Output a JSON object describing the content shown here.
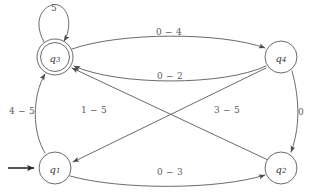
{
  "diagram": {
    "type": "finite-state-automaton",
    "colors": {
      "stroke": "#5a5a5a",
      "start_arrow": "#2b2b2b",
      "text": "#5a5a5a",
      "state_text": "#3a3a3a",
      "background": "#ffffff"
    },
    "states": [
      {
        "id": "q1",
        "label_base": "q",
        "label_sub": "1",
        "cx": 55,
        "cy": 168,
        "r": 16,
        "accepting": false,
        "start": true
      },
      {
        "id": "q2",
        "label_base": "q",
        "label_sub": "2",
        "cx": 281,
        "cy": 168,
        "r": 16,
        "accepting": false,
        "start": false
      },
      {
        "id": "q3",
        "label_base": "q",
        "label_sub": "3",
        "cx": 55,
        "cy": 57,
        "r": 18,
        "r_inner": 15,
        "accepting": true,
        "start": false
      },
      {
        "id": "q4",
        "label_base": "q",
        "label_sub": "4",
        "cx": 281,
        "cy": 57,
        "r": 16,
        "accepting": false,
        "start": false
      }
    ],
    "transitions": [
      {
        "id": "t-q3-self",
        "from": "q3",
        "to": "q3",
        "label": "5",
        "label_x": 54,
        "label_y": 8,
        "kind": "self-loop"
      },
      {
        "id": "t-q3-q4-top",
        "from": "q3",
        "to": "q4",
        "label": "0 − 4",
        "label_x": 169,
        "label_y": 32,
        "kind": "curve-top"
      },
      {
        "id": "t-q4-q3-bottom",
        "from": "q4",
        "to": "q3",
        "label": "0 − 2",
        "label_x": 170,
        "label_y": 76,
        "kind": "curve-bottom"
      },
      {
        "id": "t-q1-q3-left",
        "from": "q1",
        "to": "q3",
        "label": "4 − 5",
        "label_x": 22,
        "label_y": 111,
        "kind": "curve-left"
      },
      {
        "id": "t-q4-q1-diagonal",
        "from": "q4",
        "to": "q1",
        "label": "1 − 5",
        "label_x": 94,
        "label_y": 110,
        "kind": "diagonal"
      },
      {
        "id": "t-q2-q3-diagonal",
        "from": "q2",
        "to": "q3",
        "label": "3 − 5",
        "label_x": 227,
        "label_y": 110,
        "kind": "diagonal"
      },
      {
        "id": "t-q4-q2-right",
        "from": "q4",
        "to": "q2",
        "label": "0",
        "label_x": 301,
        "label_y": 112,
        "kind": "curve-right"
      },
      {
        "id": "t-q1-q2-bottom",
        "from": "q1",
        "to": "q2",
        "label": "0 − 3",
        "label_x": 170,
        "label_y": 172,
        "kind": "curve-bottom"
      }
    ],
    "start_marker": {
      "id": "start-arrow",
      "target": "q1",
      "x1": 8,
      "y1": 168,
      "x2": 36,
      "y2": 168
    }
  }
}
